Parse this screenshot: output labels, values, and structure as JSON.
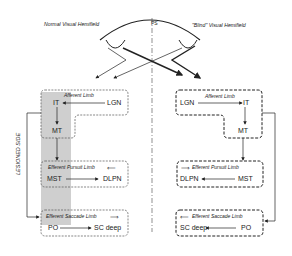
{
  "header": {
    "left_label": "Normal Visual Hemifield",
    "right_label": "\"Blind\" Visual Hemifield",
    "center_label": "PS"
  },
  "side_label": "LESIONED SIDE",
  "left": {
    "afferent": {
      "title": "Afferent Limb",
      "nodes": [
        "IT",
        "LGN",
        "MT"
      ]
    },
    "pursuit": {
      "title": "Efferent Pursuit Limb",
      "from": "MST",
      "to": "DLPN"
    },
    "saccade": {
      "title": "Efferent Saccade Limb",
      "from": "PO",
      "to": "SC deep"
    }
  },
  "right": {
    "afferent": {
      "title": "Afferent Limb",
      "nodes": [
        "LGN",
        "IT",
        "MT"
      ]
    },
    "pursuit": {
      "title": "Efferent Pursuit Limb",
      "from": "MST",
      "to": "DLPN"
    },
    "saccade": {
      "title": "Efferent Saccade Limb",
      "from": "PO",
      "to": "SC deep"
    }
  },
  "colors": {
    "shade": "#cfcfcf",
    "line": "#222222",
    "background": "#ffffff"
  }
}
